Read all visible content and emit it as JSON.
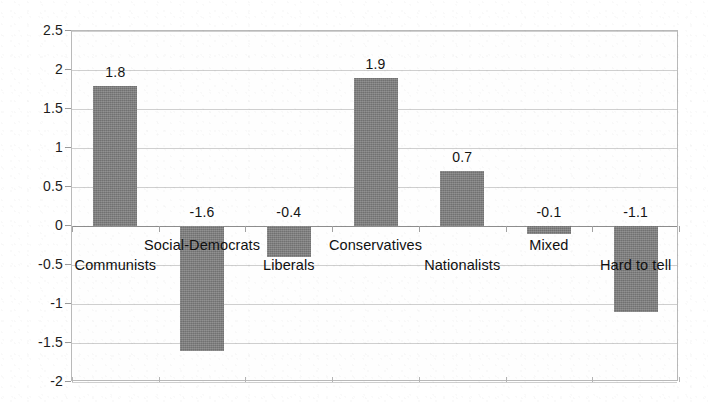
{
  "chart_data": {
    "type": "bar",
    "title": "",
    "subtitle": "",
    "xlabel": "",
    "ylabel": "",
    "categories": [
      "Communists",
      "Social-Democrats",
      "Liberals",
      "Conservatives",
      "Nationalists",
      "Mixed",
      "Hard to tell"
    ],
    "values": [
      1.8,
      -1.6,
      -0.4,
      1.9,
      0.7,
      -0.1,
      -1.1
    ],
    "value_labels": [
      "1.8",
      "-1.6",
      "-0.4",
      "1.9",
      "0.7",
      "-0.1",
      "-1.1"
    ],
    "ylim": [
      -2,
      2.5
    ],
    "yticks": [
      2.5,
      2,
      1.5,
      1,
      0.5,
      0,
      -0.5,
      -1,
      -1.5,
      -2
    ],
    "ytick_labels": [
      "2.5",
      "2",
      "1.5",
      "1",
      "0.5",
      "0",
      "-0.5",
      "-1",
      "-1.5",
      "-2"
    ],
    "grid": true,
    "grid_axis": "y",
    "legend": false,
    "legend_position": "none",
    "bar_color": "#7c7c7c",
    "gridline_color": "#cfcfcf",
    "axis_color": "#8d8d8d",
    "plot_border_color": "#b9b9b9",
    "background_color": "#ffffff",
    "text_color": "#141414",
    "data_labels_shown": true,
    "category_label_placement": "alternating-inside-plot"
  }
}
